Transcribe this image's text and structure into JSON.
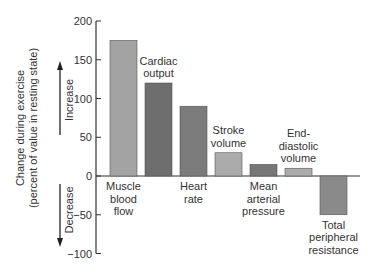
{
  "chart_data": {
    "type": "bar",
    "title": "",
    "xlabel": "",
    "ylabel": "Change during exercise (percent of value in resting state)",
    "ylabel_lines": [
      "Change during exercise",
      "(percent of value in resting state)"
    ],
    "ylim": [
      -100,
      200
    ],
    "yticks": [
      200,
      150,
      100,
      50,
      0,
      -50,
      -100
    ],
    "ytick_labels": [
      "200",
      "150",
      "100",
      "50",
      "0",
      "−50",
      "−100"
    ],
    "grid": false,
    "annotations": {
      "increase": "Increase",
      "decrease": "Decrease"
    },
    "categories": [
      "Muscle blood flow",
      "Cardiac output",
      "Heart rate",
      "Stroke volume",
      "Mean arterial pressure",
      "End-diastolic volume",
      "Total peripheral resistance"
    ],
    "category_label_lines": [
      [
        "Muscle",
        "blood",
        "flow"
      ],
      [
        "Cardiac",
        "output"
      ],
      [
        "Heart",
        "rate"
      ],
      [
        "Stroke",
        "volume"
      ],
      [
        "Mean",
        "arterial",
        "pressure"
      ],
      [
        "End-",
        "diastolic",
        "volume"
      ],
      [
        "Total",
        "peripheral",
        "resistance"
      ]
    ],
    "label_position": [
      "below",
      "above",
      "below",
      "above",
      "below",
      "above",
      "below"
    ],
    "values": [
      175,
      120,
      90,
      30,
      15,
      10,
      -50
    ],
    "colors": [
      "#a3a3a3",
      "#6e6e6e",
      "#7b7b7b",
      "#ababab",
      "#777777",
      "#ababab",
      "#8a8a8a"
    ]
  }
}
